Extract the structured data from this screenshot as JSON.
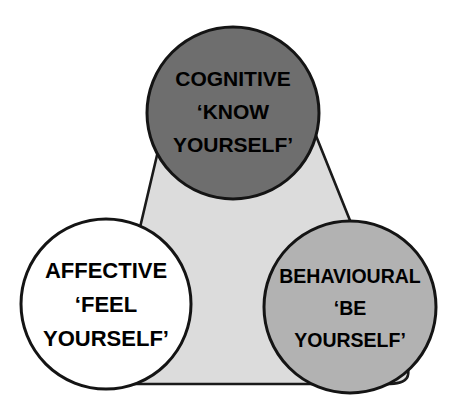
{
  "diagram": {
    "type": "venn-triangle",
    "title": "",
    "background_color": "#ffffff",
    "triangle": {
      "name": "self-awareness-triangle",
      "fill_color": "#dcdcdc",
      "stroke_color": "#1a1a1a",
      "apex": [
        233,
        30
      ],
      "bottom_left": [
        95,
        384
      ],
      "bottom_right": [
        420,
        384
      ]
    },
    "nodes": [
      {
        "id": "cognitive",
        "position": "top",
        "fill_color": "#6e6e6e",
        "stroke_color": "#141414",
        "center": [
          233,
          113
        ],
        "radius": 86,
        "lines": [
          "COGNITIVE",
          "‘KNOW",
          "YOURSELF’"
        ]
      },
      {
        "id": "affective",
        "position": "bottom-left",
        "fill_color": "#ffffff",
        "stroke_color": "#141414",
        "center": [
          106,
          304
        ],
        "radius": 85,
        "lines": [
          "AFFECTIVE",
          "‘FEEL",
          "YOURSELF’"
        ]
      },
      {
        "id": "behavioural",
        "position": "bottom-right",
        "fill_color": "#b2b2b2",
        "stroke_color": "#141414",
        "center": [
          350,
          307
        ],
        "radius": 86,
        "lines": [
          "BEHAVIOURAL",
          "‘BE",
          "YOURSELF’"
        ]
      }
    ]
  }
}
